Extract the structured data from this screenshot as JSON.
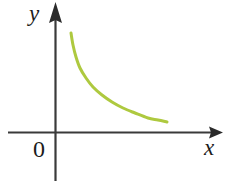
{
  "figure": {
    "background_color": "#ffffff",
    "width": 229,
    "height": 181
  },
  "axes": {
    "color": "#3a3a3a",
    "x_axis": {
      "label": "x",
      "label_name": "x-axis-label",
      "y_pixel": 132,
      "start_x": 8,
      "arrow_tip_x": 223
    },
    "y_axis": {
      "label": "y",
      "label_name": "y-axis-label",
      "x_pixel": 55,
      "arrow_tip_y": 2,
      "end_y": 181
    },
    "origin": {
      "label": "0"
    }
  },
  "chart_data": {
    "type": "line",
    "title": "",
    "subtitle": "",
    "xlabel": "x",
    "ylabel": "y",
    "origin_label": "0",
    "grid": false,
    "legend": false,
    "axis_arrows": true,
    "series": [
      {
        "name": "decreasing-curve",
        "color": "#aec93f",
        "line_width": 3,
        "description": "smooth decreasing convex curve resembling a hyperbola y = k/x in the first quadrant",
        "points_px": [
          [
            71,
            33
          ],
          [
            73,
            45
          ],
          [
            76,
            57
          ],
          [
            80,
            68
          ],
          [
            86,
            78
          ],
          [
            93,
            87
          ],
          [
            102,
            95
          ],
          [
            112,
            102
          ],
          [
            123,
            108
          ],
          [
            135,
            113
          ],
          [
            148,
            118
          ],
          [
            158,
            120
          ],
          [
            167,
            122
          ]
        ]
      }
    ],
    "xlim": [
      0,
      229
    ],
    "ylim": [
      0,
      181
    ]
  }
}
